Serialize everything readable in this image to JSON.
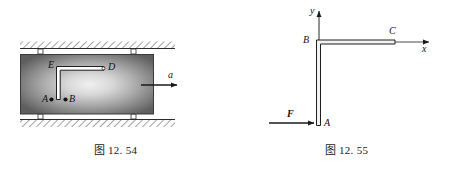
{
  "page": {
    "background": "#ffffff",
    "width": 462,
    "height": 171
  },
  "figures": [
    {
      "id": "fig-12-54",
      "caption": "图 12. 54",
      "description": "Rectangular block on rollers between two hatched fixed surfaces, containing a bent bar from A to D, accelerating to the right",
      "labels": {
        "point_a": "A",
        "point_b": "B",
        "point_d": "D",
        "point_e": "E",
        "acceleration": "a"
      },
      "colors": {
        "block_edge": "#5a5a5a",
        "block_center": "#e8e8e8",
        "outline": "#2b2b2b",
        "bar_fill": "#ffffff"
      }
    },
    {
      "id": "fig-12-55",
      "caption": "图 12. 55",
      "description": "L-shaped bar ABC in xy coordinate system with force F applied horizontally at A",
      "labels": {
        "axis_x": "x",
        "axis_y": "y",
        "point_a": "A",
        "point_b": "B",
        "point_c": "C",
        "force": "F"
      },
      "colors": {
        "outline": "#2b2b2b",
        "bar_fill": "#f2f2f2",
        "axis": "#4a4a4a"
      }
    }
  ]
}
